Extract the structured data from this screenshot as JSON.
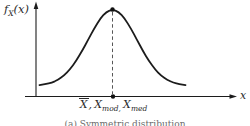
{
  "figure": {
    "y_axis_label": {
      "f": "f",
      "sub": "X",
      "paren": "(x)"
    },
    "x_axis_label": "x",
    "mean_label": {
      "x1": "X",
      "c1": ",",
      "x2": "X",
      "s2": "mod,",
      "x3": "X",
      "s3": "med"
    },
    "caption": "(a) Symmetric distribution",
    "colors": {
      "ink": "#1c1c1c",
      "text": "#2a2a2a"
    }
  },
  "chart_data": {
    "type": "line",
    "title": "",
    "xlabel": "x",
    "ylabel": "fX(x)",
    "caption": "(a) Symmetric distribution",
    "x_tick_labels": [
      "X̄, Xmod, Xmed"
    ],
    "grid": false,
    "legend": "none",
    "xlim": [
      -3.6,
      4.9
    ],
    "ylim": [
      0,
      1.15
    ],
    "series": [
      {
        "name": "symmetric probability density (bell curve)",
        "x": [
          -3,
          -2.75,
          -2.5,
          -2.25,
          -2,
          -1.75,
          -1.5,
          -1.25,
          -1,
          -0.75,
          -0.5,
          -0.25,
          0,
          0.25,
          0.5,
          0.75,
          1,
          1.25,
          1.5,
          1.75,
          2,
          2.25,
          2.5,
          2.75,
          3
        ],
        "y": [
          0.011,
          0.023,
          0.044,
          0.08,
          0.135,
          0.216,
          0.325,
          0.458,
          0.607,
          0.755,
          0.882,
          0.969,
          1,
          0.969,
          0.882,
          0.755,
          0.607,
          0.458,
          0.325,
          0.216,
          0.135,
          0.08,
          0.044,
          0.023,
          0.011
        ]
      }
    ],
    "annotations": [
      {
        "type": "point",
        "x": 0,
        "y": 1,
        "label": "peak marker dot"
      },
      {
        "type": "vline",
        "x": 0,
        "style": "dashed",
        "label": "mean = mode = median"
      },
      {
        "type": "point",
        "x": 0,
        "y": 0,
        "label": "axis marker dot at X̄, Xmod, Xmed"
      }
    ]
  }
}
